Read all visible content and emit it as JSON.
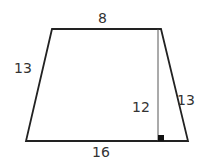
{
  "figure": {
    "shape": "isosceles trapezoid",
    "labels": {
      "top_base": "8",
      "bottom_base": "16",
      "left_side": "13",
      "right_side": "13",
      "height": "12"
    },
    "colors": {
      "stroke": "#222222",
      "text": "#333333",
      "background": "#ffffff"
    }
  }
}
